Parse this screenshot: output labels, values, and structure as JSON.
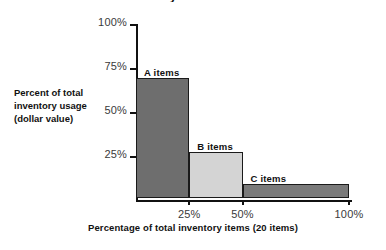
{
  "chart_data": {
    "type": "bar",
    "title": "ABC inventory classification",
    "categories": [
      "A items",
      "B items",
      "C items"
    ],
    "values": [
      68,
      26,
      8
    ],
    "x_segments": [
      [
        0,
        25
      ],
      [
        25,
        50
      ],
      [
        50,
        100
      ]
    ],
    "bar_colors": [
      "#6e6e6e",
      "#d4d4d4",
      "#7a7a7a"
    ],
    "xlabel": "Percentage of total inventory items (20 items)",
    "ylabel": "Percent of total inventory usage (dollar value)",
    "ylabel_lines": [
      "Percent of total",
      "inventory usage",
      "(dollar value)"
    ],
    "xlim": [
      0,
      100
    ],
    "ylim": [
      0,
      100
    ],
    "xticks": [
      25,
      50,
      100
    ],
    "xtick_labels": [
      "25%",
      "50%",
      "100%"
    ],
    "yticks": [
      25,
      50,
      75,
      100
    ],
    "ytick_labels": [
      "25%",
      "50%",
      "75%",
      "100%"
    ],
    "grid": false,
    "legend": "none",
    "annotations": [
      "A items",
      "B items",
      "C items"
    ]
  },
  "axes": {
    "y_ticks": [
      {
        "label": "100%",
        "value": 100
      },
      {
        "label": "75%",
        "value": 75
      },
      {
        "label": "50%",
        "value": 50
      },
      {
        "label": "25%",
        "value": 25
      }
    ],
    "x_ticks": [
      {
        "label": "25%",
        "value": 25
      },
      {
        "label": "50%",
        "value": 50
      },
      {
        "label": "100%",
        "value": 100
      }
    ]
  },
  "bars": [
    {
      "label": "A items",
      "value": 68,
      "x_start": 0,
      "x_end": 25,
      "color": "#6e6e6e"
    },
    {
      "label": "B items",
      "value": 26,
      "x_start": 25,
      "x_end": 50,
      "color": "#d4d4d4"
    },
    {
      "label": "C items",
      "value": 8,
      "x_start": 50,
      "x_end": 100,
      "color": "#7a7a7a"
    }
  ],
  "labels": {
    "y_line_1": "Percent of total",
    "y_line_2": "inventory usage",
    "y_line_3": "(dollar value)",
    "x_caption": "Percentage of total inventory items (20 items)",
    "title": "ABC inventory classification"
  }
}
